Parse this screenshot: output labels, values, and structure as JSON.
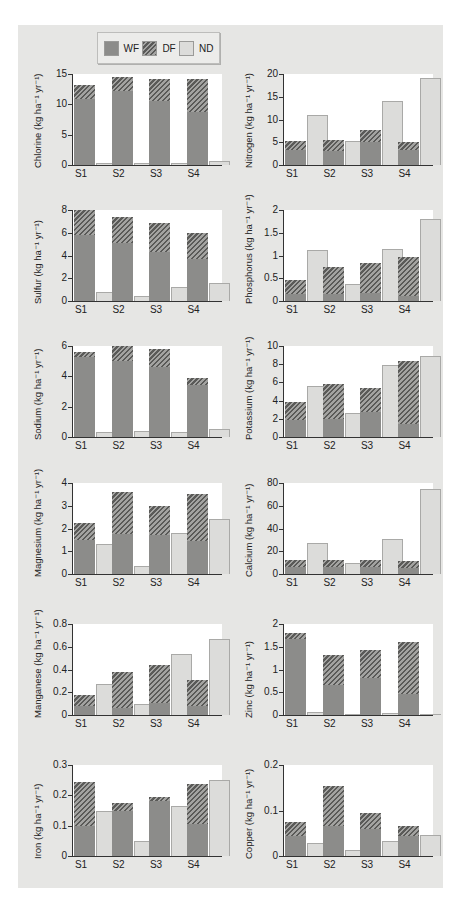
{
  "legend": {
    "items": [
      {
        "key": "WF",
        "label": "WF"
      },
      {
        "key": "DF",
        "label": "DF"
      },
      {
        "key": "ND",
        "label": "ND"
      }
    ]
  },
  "colors": {
    "WF": "#8c8c8a",
    "DF": "hatched #5a5a58/#a3a3a1",
    "ND": "#dcdcda",
    "panel": "#e6e6e4",
    "plot": "#ffffff"
  },
  "chart_data": [
    {
      "type": "bar",
      "title": "",
      "ylabel": "Chlorine (kg ha⁻¹ yr⁻¹)",
      "xlabel": "",
      "categories": [
        "S1",
        "S2",
        "S3",
        "S4"
      ],
      "ylim": [
        0,
        15
      ],
      "yticks": [
        0,
        5,
        10,
        15
      ],
      "stacked_WF_DF": true,
      "series": [
        {
          "name": "WF",
          "values": [
            10.9,
            12.2,
            10.5,
            8.7
          ]
        },
        {
          "name": "DF",
          "values": [
            2.3,
            2.3,
            3.6,
            5.4
          ]
        },
        {
          "name": "ND",
          "values": [
            0.4,
            0.4,
            0.4,
            0.6
          ]
        }
      ]
    },
    {
      "type": "bar",
      "title": "",
      "ylabel": "Nitrogen (kg ha⁻¹ yr⁻¹)",
      "xlabel": "",
      "categories": [
        "S1",
        "S2",
        "S3",
        "S4"
      ],
      "ylim": [
        0,
        20
      ],
      "yticks": [
        0,
        5,
        10,
        15,
        20
      ],
      "stacked_WF_DF": true,
      "series": [
        {
          "name": "WF",
          "values": [
            3.3,
            3.0,
            5.0,
            3.2
          ]
        },
        {
          "name": "DF",
          "values": [
            2.0,
            2.5,
            2.7,
            1.9
          ]
        },
        {
          "name": "ND",
          "values": [
            10.9,
            5.3,
            14.1,
            19.1
          ]
        }
      ]
    },
    {
      "type": "bar",
      "title": "",
      "ylabel": "Sulfur (kg ha⁻¹ yr⁻¹)",
      "xlabel": "",
      "categories": [
        "S1",
        "S2",
        "S3",
        "S4"
      ],
      "ylim": [
        0,
        8
      ],
      "yticks": [
        0,
        2,
        4,
        6,
        8
      ],
      "stacked_WF_DF": true,
      "series": [
        {
          "name": "WF",
          "values": [
            5.8,
            5.1,
            4.3,
            3.7
          ]
        },
        {
          "name": "DF",
          "values": [
            2.2,
            2.3,
            2.6,
            2.3
          ]
        },
        {
          "name": "ND",
          "values": [
            0.8,
            0.4,
            1.2,
            1.6
          ]
        }
      ]
    },
    {
      "type": "bar",
      "title": "",
      "ylabel": "Phosphorus (kg ha⁻¹ yr⁻¹)",
      "xlabel": "",
      "categories": [
        "S1",
        "S2",
        "S3",
        "S4"
      ],
      "ylim": [
        0,
        2.0
      ],
      "yticks": [
        0,
        0.5,
        1.0,
        1.5,
        2.0
      ],
      "stacked_WF_DF": true,
      "series": [
        {
          "name": "WF",
          "values": [
            0.15,
            0.15,
            0.18,
            0.1
          ]
        },
        {
          "name": "DF",
          "values": [
            0.32,
            0.59,
            0.65,
            0.87
          ]
        },
        {
          "name": "ND",
          "values": [
            1.12,
            0.38,
            1.15,
            1.8
          ]
        }
      ]
    },
    {
      "type": "bar",
      "title": "",
      "ylabel": "Sodium (kg ha⁻¹ yr⁻¹)",
      "xlabel": "",
      "categories": [
        "S1",
        "S2",
        "S3",
        "S4"
      ],
      "ylim": [
        0,
        6
      ],
      "yticks": [
        0,
        2,
        4,
        6
      ],
      "stacked_WF_DF": true,
      "series": [
        {
          "name": "WF",
          "values": [
            5.3,
            5.0,
            4.6,
            3.4
          ]
        },
        {
          "name": "DF",
          "values": [
            0.3,
            1.0,
            1.2,
            0.5
          ]
        },
        {
          "name": "ND",
          "values": [
            0.3,
            0.4,
            0.3,
            0.5
          ]
        }
      ]
    },
    {
      "type": "bar",
      "title": "",
      "ylabel": "Potassium (kg ha⁻¹ yr⁻¹)",
      "xlabel": "",
      "categories": [
        "S1",
        "S2",
        "S3",
        "S4"
      ],
      "ylim": [
        0,
        10
      ],
      "yticks": [
        0,
        2,
        4,
        6,
        8,
        10
      ],
      "stacked_WF_DF": true,
      "series": [
        {
          "name": "WF",
          "values": [
            1.9,
            2.0,
            2.7,
            1.4
          ]
        },
        {
          "name": "DF",
          "values": [
            1.9,
            3.8,
            2.7,
            7.0
          ]
        },
        {
          "name": "ND",
          "values": [
            5.6,
            2.6,
            7.9,
            8.9
          ]
        }
      ]
    },
    {
      "type": "bar",
      "title": "",
      "ylabel": "Magnesium (kg ha⁻¹ yr⁻¹)",
      "xlabel": "",
      "categories": [
        "S1",
        "S2",
        "S3",
        "S4"
      ],
      "ylim": [
        0,
        4
      ],
      "yticks": [
        0,
        1,
        2,
        3,
        4
      ],
      "stacked_WF_DF": true,
      "series": [
        {
          "name": "WF",
          "values": [
            1.5,
            1.75,
            1.7,
            1.45
          ]
        },
        {
          "name": "DF",
          "values": [
            0.75,
            1.85,
            1.3,
            2.05
          ]
        },
        {
          "name": "ND",
          "values": [
            1.3,
            0.35,
            1.8,
            2.4
          ]
        }
      ]
    },
    {
      "type": "bar",
      "title": "",
      "ylabel": "Calcium (kg ha⁻¹ yr⁻¹)",
      "xlabel": "",
      "categories": [
        "S1",
        "S2",
        "S3",
        "S4"
      ],
      "ylim": [
        0,
        80
      ],
      "yticks": [
        0,
        20,
        40,
        60,
        80
      ],
      "stacked_WF_DF": true,
      "series": [
        {
          "name": "WF",
          "values": [
            6,
            6,
            6,
            5
          ]
        },
        {
          "name": "DF",
          "values": [
            6.5,
            6.5,
            6,
            6.5
          ]
        },
        {
          "name": "ND",
          "values": [
            27.5,
            10,
            31,
            75
          ]
        }
      ]
    },
    {
      "type": "bar",
      "title": "",
      "ylabel": "Manganese (kg ha⁻¹ yr⁻¹)",
      "xlabel": "",
      "categories": [
        "S1",
        "S2",
        "S3",
        "S4"
      ],
      "ylim": [
        0,
        0.8
      ],
      "yticks": [
        0,
        0.2,
        0.4,
        0.6,
        0.8
      ],
      "stacked_WF_DF": true,
      "series": [
        {
          "name": "WF",
          "values": [
            0.08,
            0.06,
            0.11,
            0.08
          ]
        },
        {
          "name": "DF",
          "values": [
            0.1,
            0.32,
            0.33,
            0.23
          ]
        },
        {
          "name": "ND",
          "values": [
            0.27,
            0.1,
            0.54,
            0.67
          ]
        }
      ]
    },
    {
      "type": "bar",
      "title": "",
      "ylabel": "Zinc (kg ha⁻¹ yr⁻¹)",
      "xlabel": "",
      "categories": [
        "S1",
        "S2",
        "S3",
        "S4"
      ],
      "ylim": [
        0,
        2.0
      ],
      "yticks": [
        0,
        0.5,
        1.0,
        1.5,
        2.0
      ],
      "stacked_WF_DF": true,
      "series": [
        {
          "name": "WF",
          "values": [
            1.68,
            0.65,
            0.82,
            0.46
          ]
        },
        {
          "name": "DF",
          "values": [
            0.12,
            0.67,
            0.6,
            1.14
          ]
        },
        {
          "name": "ND",
          "values": [
            0.06,
            0.01,
            0.04,
            0.03
          ]
        }
      ]
    },
    {
      "type": "bar",
      "title": "",
      "ylabel": "Iron (kg ha⁻¹ yr⁻¹)",
      "xlabel": "",
      "categories": [
        "S1",
        "S2",
        "S3",
        "S4"
      ],
      "ylim": [
        0,
        0.3
      ],
      "yticks": [
        0,
        0.1,
        0.2,
        0.3
      ],
      "stacked_WF_DF": true,
      "series": [
        {
          "name": "WF",
          "values": [
            0.1,
            0.15,
            0.18,
            0.105
          ]
        },
        {
          "name": "DF",
          "values": [
            0.145,
            0.025,
            0.015,
            0.133
          ]
        },
        {
          "name": "ND",
          "values": [
            0.148,
            0.05,
            0.165,
            0.252
          ]
        }
      ]
    },
    {
      "type": "bar",
      "title": "",
      "ylabel": "Copper (kg ha⁻¹ yr⁻¹)",
      "xlabel": "",
      "categories": [
        "S1",
        "S2",
        "S3",
        "S4"
      ],
      "ylim": [
        0,
        0.2
      ],
      "yticks": [
        0,
        0.1,
        0.2
      ],
      "stacked_WF_DF": true,
      "series": [
        {
          "name": "WF",
          "values": [
            0.045,
            0.065,
            0.06,
            0.045
          ]
        },
        {
          "name": "DF",
          "values": [
            0.03,
            0.09,
            0.035,
            0.022
          ]
        },
        {
          "name": "ND",
          "values": [
            0.028,
            0.013,
            0.032,
            0.046
          ]
        }
      ]
    }
  ]
}
